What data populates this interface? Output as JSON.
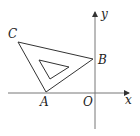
{
  "diagram": {
    "type": "coordinate-geometry",
    "axes": {
      "x_label": "x",
      "y_label": "y",
      "origin_label": "O"
    },
    "points": [
      {
        "name": "A",
        "label": "A",
        "position": "on negative x-axis"
      },
      {
        "name": "B",
        "label": "B",
        "position": "on positive y-axis"
      },
      {
        "name": "C",
        "label": "C",
        "position": "second quadrant"
      }
    ],
    "shapes": [
      {
        "type": "triangle",
        "vertices": [
          "A",
          "B",
          "C"
        ],
        "role": "outer"
      },
      {
        "type": "triangle",
        "role": "inner-hole"
      }
    ],
    "colors": {
      "axis": "#777777",
      "lines": "#333333",
      "text": "#222222",
      "background": "#ffffff"
    }
  }
}
